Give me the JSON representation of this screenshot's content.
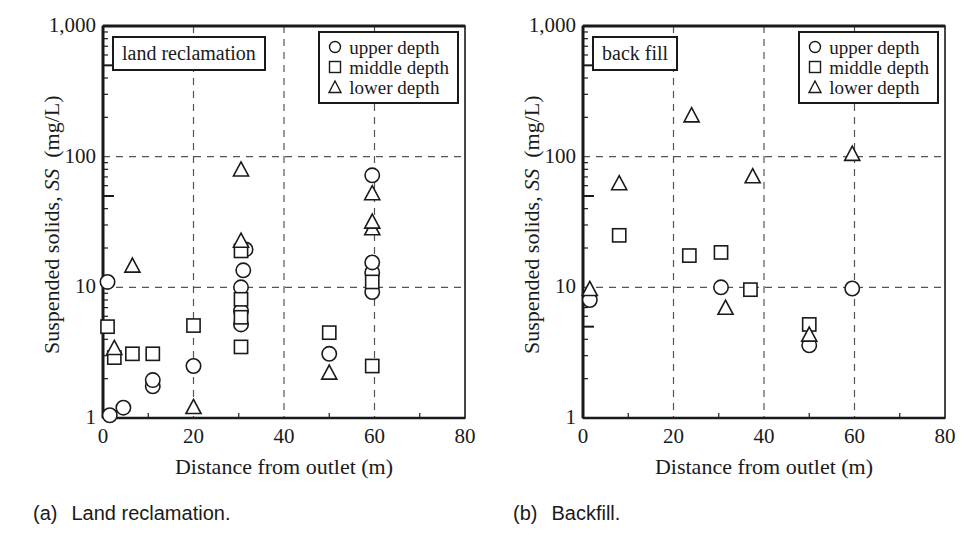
{
  "figure": {
    "panels": [
      {
        "id": "a",
        "caption_number": "(a)",
        "caption_text": "Land reclamation.",
        "plot_title": "land reclamation"
      },
      {
        "id": "b",
        "caption_number": "(b)",
        "caption_text": "Backfill.",
        "plot_title": "back fill"
      }
    ],
    "legend": {
      "entries": [
        {
          "marker": "circle-marker",
          "label": "upper depth"
        },
        {
          "marker": "square-marker",
          "label": "middle depth"
        },
        {
          "marker": "triangle-marker",
          "label": "lower depth"
        }
      ]
    },
    "axis_color": "#1a1a1a",
    "grid_color": "#555555"
  },
  "chart_data": [
    {
      "type": "scatter",
      "panel": "a",
      "title": "land reclamation",
      "caption": "(a)  Land reclamation.",
      "xlabel": "Distance from outlet  (m)",
      "ylabel": "Suspended solids, SS  (mg/L)",
      "xlim": [
        0,
        80
      ],
      "ylim": [
        1,
        1000
      ],
      "yscale": "log",
      "xscale": "linear",
      "xticks": [
        0,
        20,
        40,
        60,
        80
      ],
      "xtick_labels": [
        "0",
        "20",
        "40",
        "60",
        "80"
      ],
      "yticks": [
        1,
        10,
        100,
        1000
      ],
      "ytick_labels": [
        "1",
        "10",
        "100",
        "1,000"
      ],
      "grid": "dashed at x=20,40,60 and y=10,100",
      "legend_position": "top-right inside",
      "series": [
        {
          "name": "upper depth",
          "marker": "circle",
          "points": [
            [
              1.0,
              11.0
            ],
            [
              1.5,
              1.05
            ],
            [
              4.5,
              1.2
            ],
            [
              11.0,
              1.75
            ],
            [
              11.0,
              1.95
            ],
            [
              20.0,
              2.5
            ],
            [
              30.5,
              5.2
            ],
            [
              30.5,
              6.6
            ],
            [
              30.5,
              10.0
            ],
            [
              31.0,
              13.5
            ],
            [
              31.5,
              19.5
            ],
            [
              50.0,
              3.1
            ],
            [
              59.5,
              9.2
            ],
            [
              59.5,
              13.0
            ],
            [
              59.5,
              15.5
            ],
            [
              59.5,
              72.0
            ]
          ]
        },
        {
          "name": "middle depth",
          "marker": "square",
          "points": [
            [
              1.0,
              5.0
            ],
            [
              2.5,
              2.9
            ],
            [
              6.5,
              3.1
            ],
            [
              11.0,
              3.1
            ],
            [
              20.0,
              5.1
            ],
            [
              30.5,
              3.5
            ],
            [
              30.5,
              5.9
            ],
            [
              30.5,
              8.1
            ],
            [
              30.5,
              19.0
            ],
            [
              50.0,
              4.5
            ],
            [
              59.5,
              2.5
            ],
            [
              59.5,
              11.0
            ]
          ]
        },
        {
          "name": "lower depth",
          "marker": "triangle",
          "points": [
            [
              2.5,
              3.4
            ],
            [
              6.5,
              14.5
            ],
            [
              20.0,
              1.2
            ],
            [
              30.5,
              22.5
            ],
            [
              30.5,
              79.0
            ],
            [
              50.0,
              2.2
            ],
            [
              59.5,
              28.0
            ],
            [
              59.5,
              31.5
            ],
            [
              59.5,
              52.0
            ]
          ]
        }
      ]
    },
    {
      "type": "scatter",
      "panel": "b",
      "title": "back fill",
      "caption": "(b)  Backfill.",
      "xlabel": "Distance from outlet (m)",
      "ylabel": "Suspended solids, SS  (mg/L)",
      "xlim": [
        0,
        80
      ],
      "ylim": [
        1,
        1000
      ],
      "yscale": "log",
      "xscale": "linear",
      "xticks": [
        0,
        20,
        40,
        60,
        80
      ],
      "xtick_labels": [
        "0",
        "20",
        "40",
        "60",
        "80"
      ],
      "yticks": [
        1,
        10,
        100,
        1000
      ],
      "ytick_labels": [
        "1",
        "10",
        "100",
        "1,000"
      ],
      "grid": "dashed at x=20,40,60 and y=10,100",
      "legend_position": "top-right inside",
      "series": [
        {
          "name": "upper depth",
          "marker": "circle",
          "points": [
            [
              1.5,
              8.0
            ],
            [
              30.5,
              10.0
            ],
            [
              50.0,
              3.6
            ],
            [
              59.5,
              9.8
            ]
          ]
        },
        {
          "name": "middle depth",
          "marker": "square",
          "points": [
            [
              8.0,
              25.0
            ],
            [
              23.5,
              17.5
            ],
            [
              30.5,
              18.5
            ],
            [
              37.0,
              9.6
            ],
            [
              50.0,
              5.2
            ]
          ]
        },
        {
          "name": "lower depth",
          "marker": "triangle",
          "points": [
            [
              1.5,
              9.6
            ],
            [
              8.0,
              62.0
            ],
            [
              24.0,
              205.0
            ],
            [
              31.5,
              6.9
            ],
            [
              37.5,
              70.0
            ],
            [
              50.0,
              4.3
            ],
            [
              59.5,
              104.0
            ]
          ]
        }
      ]
    }
  ]
}
